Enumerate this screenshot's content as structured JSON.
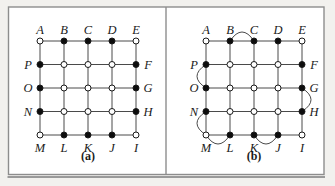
{
  "figure": {
    "background": "#f2f1ee",
    "frame": {
      "x": 8.5,
      "y": 7,
      "width": 315.5,
      "height": 167.5,
      "fill": "#ffffff",
      "border_color": "#8d8d8d",
      "shadow_color": "#9a9a9a",
      "divider_x": 166
    },
    "colors": {
      "line": "#4a4a4a",
      "node_fill": "#0d0d0d",
      "node_open": "#ffffff",
      "node_stroke": "#1a1a1a",
      "label": "#1a1a1a"
    },
    "grid": {
      "rows": 5,
      "cols": 5,
      "spacing_x": 24,
      "spacing_y": 23.5,
      "node_radius": 3,
      "label_offset": 12,
      "top_label_offset": 11,
      "bottom_label_offset": 13,
      "caption_offset_y": 25,
      "arc_bulge": 9
    },
    "vertex_labels": [
      {
        "id": "A",
        "col": 0,
        "row": 0,
        "side": "top",
        "filled": false
      },
      {
        "id": "B",
        "col": 1,
        "row": 0,
        "side": "top",
        "filled": true
      },
      {
        "id": "C",
        "col": 2,
        "row": 0,
        "side": "top",
        "filled": true
      },
      {
        "id": "D",
        "col": 3,
        "row": 0,
        "side": "top",
        "filled": true
      },
      {
        "id": "E",
        "col": 4,
        "row": 0,
        "side": "top",
        "filled": false
      },
      {
        "id": "F",
        "col": 4,
        "row": 1,
        "side": "right",
        "filled": true
      },
      {
        "id": "G",
        "col": 4,
        "row": 2,
        "side": "right",
        "filled": true
      },
      {
        "id": "H",
        "col": 4,
        "row": 3,
        "side": "right",
        "filled": true
      },
      {
        "id": "I",
        "col": 4,
        "row": 4,
        "side": "bottom",
        "filled": false
      },
      {
        "id": "J",
        "col": 3,
        "row": 4,
        "side": "bottom",
        "filled": true
      },
      {
        "id": "K",
        "col": 2,
        "row": 4,
        "side": "bottom",
        "filled": true
      },
      {
        "id": "L",
        "col": 1,
        "row": 4,
        "side": "bottom",
        "filled": true
      },
      {
        "id": "M",
        "col": 0,
        "row": 4,
        "side": "bottom",
        "filled": false
      },
      {
        "id": "N",
        "col": 0,
        "row": 3,
        "side": "left",
        "filled": true
      },
      {
        "id": "O",
        "col": 0,
        "row": 2,
        "side": "left",
        "filled": true
      },
      {
        "id": "P",
        "col": 0,
        "row": 1,
        "side": "left",
        "filled": true
      }
    ],
    "panels": [
      {
        "caption": "(a)",
        "origin": {
          "x": 40,
          "y": 41
        },
        "extra_arcs": []
      },
      {
        "caption": "(b)",
        "origin": {
          "x": 206,
          "y": 41
        },
        "extra_arcs": [
          [
            "B",
            "C"
          ],
          [
            "P",
            "O"
          ],
          [
            "N",
            "M"
          ],
          [
            "M",
            "L"
          ],
          [
            "K",
            "J"
          ],
          [
            "G",
            "H"
          ]
        ]
      }
    ]
  }
}
